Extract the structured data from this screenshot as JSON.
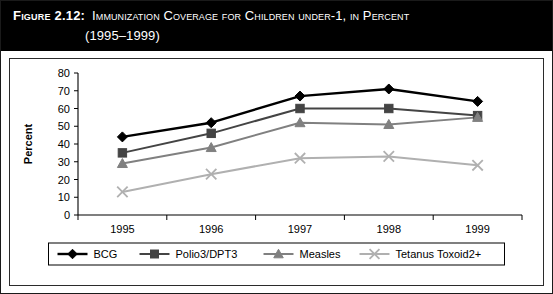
{
  "figure": {
    "label": "Figure 2.12:",
    "title": "Immunization Coverage for Children under-1, in Percent",
    "subtitle": "(1995–1999)"
  },
  "chart_data": {
    "type": "line",
    "title": "Immunization Coverage for Children under-1, in Percent (1995–1999)",
    "xlabel": "",
    "ylabel": "Percent",
    "categories": [
      "1995",
      "1996",
      "1997",
      "1998",
      "1999"
    ],
    "ylim": [
      0,
      80
    ],
    "yticks": [
      0,
      10,
      20,
      30,
      40,
      50,
      60,
      70,
      80
    ],
    "grid": false,
    "legend_position": "bottom",
    "series": [
      {
        "name": "BCG",
        "values": [
          44,
          52,
          67,
          71,
          64
        ],
        "color": "#000000",
        "marker": "diamond"
      },
      {
        "name": "Polio3/DPT3",
        "values": [
          35,
          46,
          60,
          60,
          56
        ],
        "color": "#444444",
        "marker": "square"
      },
      {
        "name": "Measles",
        "values": [
          29,
          38,
          52,
          51,
          55
        ],
        "color": "#808080",
        "marker": "triangle"
      },
      {
        "name": "Tetanus Toxoid2+",
        "values": [
          13,
          23,
          32,
          33,
          28
        ],
        "color": "#b0b0b0",
        "marker": "cross"
      }
    ]
  },
  "legend": {
    "items": [
      {
        "label": "BCG"
      },
      {
        "label": "Polio3/DPT3"
      },
      {
        "label": "Measles"
      },
      {
        "label": "Tetanus Toxoid2+"
      }
    ]
  },
  "axis": {
    "y_tick_labels": [
      "80",
      "70",
      "60",
      "50",
      "40",
      "30",
      "20",
      "10",
      "0"
    ],
    "x_tick_labels": [
      "1995",
      "1996",
      "1997",
      "1998",
      "1999"
    ],
    "y_axis_title": "Percent"
  }
}
